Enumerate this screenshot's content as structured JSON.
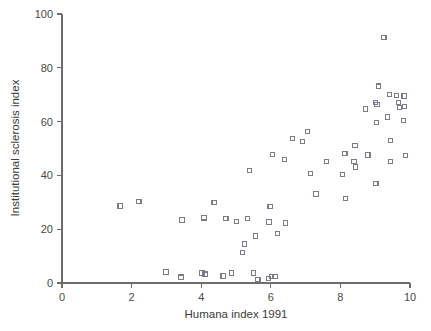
{
  "chart_data": {
    "type": "scatter",
    "title": "",
    "xlabel": "Humana index 1991",
    "ylabel": "Institutional sclerosis index",
    "xlim": [
      0,
      10
    ],
    "ylim": [
      0,
      100
    ],
    "xticks": [
      0,
      2,
      4,
      6,
      8,
      10
    ],
    "yticks": [
      0,
      20,
      40,
      60,
      80,
      100
    ],
    "xtick_labels": [
      "0",
      "2",
      "4",
      "6",
      "8",
      "10"
    ],
    "ytick_labels": [
      "0",
      "20",
      "40",
      "60",
      "80",
      "100"
    ],
    "grid": false,
    "legend": "none",
    "marker": "open-square",
    "marker_color": "#7b7b8c",
    "axis_color": "#6e6e6e",
    "points": [
      {
        "x": 1.67,
        "y": 28.6
      },
      {
        "x": 2.21,
        "y": 30.2
      },
      {
        "x": 2.99,
        "y": 4.1
      },
      {
        "x": 3.42,
        "y": 2.2
      },
      {
        "x": 3.45,
        "y": 23.4
      },
      {
        "x": 4.02,
        "y": 3.7
      },
      {
        "x": 4.11,
        "y": 3.3
      },
      {
        "x": 4.08,
        "y": 24.2
      },
      {
        "x": 4.37,
        "y": 29.9
      },
      {
        "x": 4.63,
        "y": 2.6
      },
      {
        "x": 4.71,
        "y": 24.0
      },
      {
        "x": 4.88,
        "y": 3.7
      },
      {
        "x": 5.02,
        "y": 23.0
      },
      {
        "x": 5.24,
        "y": 14.5
      },
      {
        "x": 5.18,
        "y": 11.2
      },
      {
        "x": 5.34,
        "y": 24.1
      },
      {
        "x": 5.38,
        "y": 41.8
      },
      {
        "x": 5.51,
        "y": 3.7
      },
      {
        "x": 5.56,
        "y": 17.5
      },
      {
        "x": 5.63,
        "y": 1.4
      },
      {
        "x": 5.93,
        "y": 1.6
      },
      {
        "x": 5.98,
        "y": 28.3
      },
      {
        "x": 5.95,
        "y": 22.7
      },
      {
        "x": 6.03,
        "y": 2.4
      },
      {
        "x": 6.12,
        "y": 2.5
      },
      {
        "x": 6.04,
        "y": 47.9
      },
      {
        "x": 6.19,
        "y": 18.3
      },
      {
        "x": 6.42,
        "y": 22.3
      },
      {
        "x": 6.4,
        "y": 45.9
      },
      {
        "x": 6.63,
        "y": 53.6
      },
      {
        "x": 6.92,
        "y": 52.7
      },
      {
        "x": 7.05,
        "y": 56.2
      },
      {
        "x": 7.15,
        "y": 40.7
      },
      {
        "x": 7.3,
        "y": 33.1
      },
      {
        "x": 7.61,
        "y": 45.1
      },
      {
        "x": 8.07,
        "y": 40.4
      },
      {
        "x": 8.13,
        "y": 48.2
      },
      {
        "x": 8.15,
        "y": 31.3
      },
      {
        "x": 8.42,
        "y": 51.1
      },
      {
        "x": 8.39,
        "y": 45.3
      },
      {
        "x": 8.44,
        "y": 43.1
      },
      {
        "x": 8.73,
        "y": 64.7
      },
      {
        "x": 8.79,
        "y": 47.6
      },
      {
        "x": 9.0,
        "y": 67.2
      },
      {
        "x": 9.05,
        "y": 66.4
      },
      {
        "x": 9.03,
        "y": 59.8
      },
      {
        "x": 9.02,
        "y": 37.0
      },
      {
        "x": 9.09,
        "y": 73.2
      },
      {
        "x": 9.25,
        "y": 91.4
      },
      {
        "x": 9.36,
        "y": 61.7
      },
      {
        "x": 9.42,
        "y": 70.2
      },
      {
        "x": 9.45,
        "y": 53.0
      },
      {
        "x": 9.44,
        "y": 45.1
      },
      {
        "x": 9.62,
        "y": 69.8
      },
      {
        "x": 9.68,
        "y": 67.0
      },
      {
        "x": 9.7,
        "y": 65.3
      },
      {
        "x": 9.83,
        "y": 69.5
      },
      {
        "x": 9.84,
        "y": 65.6
      },
      {
        "x": 9.82,
        "y": 60.3
      },
      {
        "x": 9.86,
        "y": 47.4
      }
    ]
  }
}
